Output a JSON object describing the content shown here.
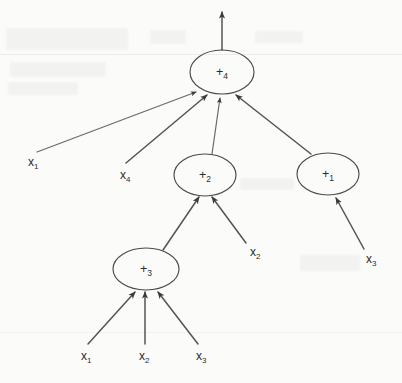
{
  "diagram": {
    "type": "node-link-tree",
    "background_color": "#fbfbfa",
    "stroke_color": "#4a4a4a",
    "text_color": "#2b2b2b",
    "nodes": [
      {
        "id": "n4",
        "base": "+",
        "subscript": "4",
        "cx": 222,
        "cy": 72,
        "rx": 32,
        "ry": 22
      },
      {
        "id": "n2",
        "base": "+",
        "subscript": "2",
        "cx": 205,
        "cy": 175,
        "rx": 31,
        "ry": 21
      },
      {
        "id": "n1",
        "base": "+",
        "subscript": "1",
        "cx": 328,
        "cy": 174,
        "rx": 31,
        "ry": 21
      },
      {
        "id": "n3",
        "base": "+",
        "subscript": "3",
        "cx": 146,
        "cy": 269,
        "rx": 33,
        "ry": 21
      }
    ],
    "inputs": [
      {
        "id": "i-x1-left",
        "base": "x",
        "subscript": "1",
        "x": 28,
        "y": 166
      },
      {
        "id": "i-x4",
        "base": "x",
        "subscript": "4",
        "x": 120,
        "y": 179
      },
      {
        "id": "i-x2-mid",
        "base": "x",
        "subscript": "2",
        "x": 250,
        "y": 256
      },
      {
        "id": "i-x3-right",
        "base": "x",
        "subscript": "3",
        "x": 366,
        "y": 263
      },
      {
        "id": "i-x1-bottom",
        "base": "x",
        "subscript": "1",
        "x": 81,
        "y": 360
      },
      {
        "id": "i-x2-bottom",
        "base": "x",
        "subscript": "2",
        "x": 139,
        "y": 360
      },
      {
        "id": "i-x3-bottom",
        "base": "x",
        "subscript": "3",
        "x": 196,
        "y": 360
      }
    ],
    "output": {
      "id": "output-arrow",
      "label": "",
      "from_node": "n4",
      "direction": "up"
    },
    "edges": [
      {
        "from": "i-x1-left",
        "to": "n4",
        "x1": 37,
        "y1": 152,
        "x2": 196,
        "y2": 92
      },
      {
        "from": "i-x4",
        "to": "n4",
        "x1": 126,
        "y1": 163,
        "x2": 207,
        "y2": 95
      },
      {
        "from": "n2",
        "to": "n4",
        "x1": 212,
        "y1": 154,
        "x2": 220,
        "y2": 98
      },
      {
        "from": "n1",
        "to": "n4",
        "x1": 311,
        "y1": 154,
        "x2": 235,
        "y2": 95
      },
      {
        "from": "n3",
        "to": "n2",
        "x1": 163,
        "y1": 250,
        "x2": 198,
        "y2": 197
      },
      {
        "from": "i-x2-mid",
        "to": "n2",
        "x1": 246,
        "y1": 243,
        "x2": 212,
        "y2": 197
      },
      {
        "from": "i-x3-right",
        "to": "n1",
        "x1": 364,
        "y1": 249,
        "x2": 336,
        "y2": 198
      },
      {
        "from": "i-x1-bottom",
        "to": "n3",
        "x1": 88,
        "y1": 344,
        "x2": 135,
        "y2": 292
      },
      {
        "from": "i-x2-bottom",
        "to": "n3",
        "x1": 145,
        "y1": 344,
        "x2": 145,
        "y2": 292
      },
      {
        "from": "i-x3-bottom",
        "to": "n3",
        "x1": 198,
        "y1": 344,
        "x2": 157,
        "y2": 292
      }
    ]
  }
}
